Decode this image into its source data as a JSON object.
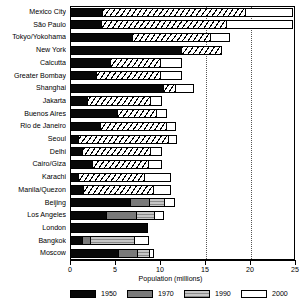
{
  "chart_data": {
    "type": "bar",
    "orientation": "horizontal",
    "stacked": true,
    "title": "",
    "xlabel": "Population (millions)",
    "ylabel": "",
    "xlim": [
      0,
      25
    ],
    "xticks": [
      0,
      5,
      10,
      15,
      20,
      25
    ],
    "xtick_labels": [
      "0",
      "5",
      "10",
      "15",
      "20",
      "25"
    ],
    "grid": "dotted vertical gridlines at 15 and 20",
    "gridlines": [
      15,
      20
    ],
    "legend_position": "bottom",
    "categories": [
      "Mexico City",
      "São Paulo",
      "Tokyo/Yokohama",
      "New York",
      "Calcutta",
      "Greater Bombay",
      "Shanghai",
      "Jakarta",
      "Buenos Aires",
      "Rio de Janeiro",
      "Seoul",
      "Delhi",
      "Cairo/Giza",
      "Karachi",
      "Manila/Quezon",
      "Beijing",
      "Los Angeles",
      "London",
      "Bangkok",
      "Moscow"
    ],
    "series": [
      {
        "name": "1950",
        "color": "#080808",
        "values": [
          3.7,
          3.5,
          7.0,
          12.4,
          4.6,
          3.0,
          10.4,
          2.0,
          5.3,
          3.4,
          1.0,
          1.4,
          2.5,
          1.0,
          1.6,
          6.8,
          4.1,
          8.7,
          1.4,
          5.4
        ]
      },
      {
        "name": "1970",
        "color": "#7a7a7a",
        "values": [
          0,
          0,
          0,
          0,
          0,
          0,
          0,
          0,
          0,
          0,
          0,
          0,
          0,
          0,
          0,
          2.2,
          3.5,
          0,
          1.1,
          2.3
        ]
      },
      {
        "name": "1990",
        "color": "#c6c6c6",
        "values": [
          16.0,
          14.0,
          8.8,
          4.6,
          5.6,
          7.2,
          1.5,
          7.1,
          4.5,
          7.5,
          10.1,
          7.7,
          6.4,
          7.4,
          7.8,
          1.8,
          2.1,
          0,
          5.0,
          1.4
        ]
      },
      {
        "name": "2000",
        "color": "#ffffff",
        "values": [
          5.3,
          7.5,
          2.2,
          0,
          2.5,
          2.5,
          2.1,
          1.4,
          1.2,
          1.1,
          1.0,
          1.4,
          1.6,
          3.1,
          2.1,
          1.2,
          1.1,
          0,
          1.6,
          0.6
        ]
      }
    ],
    "totals": [
      25.0,
      25.0,
      18.0,
      17.0,
      12.7,
      12.7,
      14.0,
      10.5,
      11.0,
      12.0,
      12.1,
      10.5,
      10.5,
      11.5,
      11.5,
      12.0,
      10.8,
      8.7,
      9.1,
      9.7
    ]
  },
  "legend": {
    "items": [
      {
        "label": "1950",
        "swatch": "swatch-1950"
      },
      {
        "label": "1970",
        "swatch": "swatch-1970"
      },
      {
        "label": "1990",
        "swatch": "swatch-1990"
      },
      {
        "label": "2000",
        "swatch": "swatch-2000"
      }
    ]
  },
  "axis": {
    "title": "Population (millions)"
  }
}
